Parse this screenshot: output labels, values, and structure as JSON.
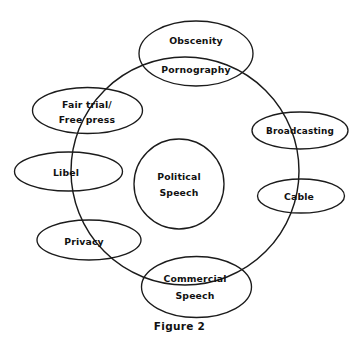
{
  "figure": {
    "caption": "Figure 2",
    "center_node": {
      "label_line1": "Political",
      "label_line2": "Speech",
      "name": "political-speech"
    },
    "top_node": {
      "label_line1": "Obscenity",
      "label_line2": "Pornography",
      "name": "obscenity-pornography"
    },
    "nodes": [
      {
        "name": "fair-trial-free-press",
        "label_line1": "Fair trial/",
        "label_line2": "Free press"
      },
      {
        "name": "libel",
        "label_line1": "Libel",
        "label_line2": ""
      },
      {
        "name": "privacy",
        "label_line1": "Privacy",
        "label_line2": ""
      },
      {
        "name": "commercial-speech",
        "label_line1": "Commercial",
        "label_line2": "Speech"
      },
      {
        "name": "broadcasting",
        "label_line1": "Broadcasting",
        "label_line2": ""
      },
      {
        "name": "cable",
        "label_line1": "Cable",
        "label_line2": ""
      }
    ],
    "colors": {
      "stroke": "#1b1b1b",
      "background": "#ffffff",
      "text": "#111111"
    }
  }
}
